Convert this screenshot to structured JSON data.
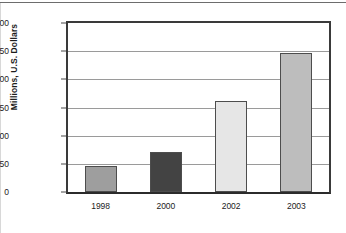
{
  "chart_data": {
    "type": "bar",
    "title": "",
    "xlabel": "",
    "ylabel": "Millions, U.S. Dollars",
    "categories": [
      "1998",
      "2000",
      "2002",
      "2003"
    ],
    "values": [
      46.3,
      71.2,
      161.2,
      247.0
    ],
    "data_labels": [
      "46.3",
      "71.2",
      "161.2",
      "247.0"
    ],
    "bar_colors": [
      "#9e9e9e",
      "#434343",
      "#e6e6e6",
      "#bdbdbd"
    ],
    "bar_edge_color": "#4d4d4d",
    "ylim": [
      0,
      300
    ],
    "yticks": [
      0,
      50,
      100,
      150,
      200,
      250,
      300
    ],
    "ytick_labels": [
      "0",
      "50",
      "100",
      "150",
      "200",
      "250",
      "300"
    ],
    "grid": true,
    "grid_axis": "y",
    "grid_color": "#9a9a9a",
    "legend": false,
    "legend_position": "none",
    "axis_color": "#3a3a3a",
    "background": "#ffffff",
    "text_color": "#1c1c1c"
  }
}
